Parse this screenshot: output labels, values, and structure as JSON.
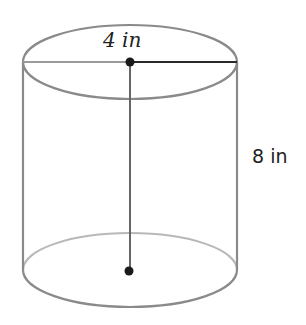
{
  "diagram": {
    "shape": "cylinder",
    "labels": {
      "radius": "4 in",
      "height": "8 in"
    },
    "colors": {
      "outline": "#8a8a8a",
      "outline_back": "#b5b5b5",
      "radius_line": "#2a2a2a",
      "dot": "#1a1a1a",
      "text": "#222222"
    }
  }
}
